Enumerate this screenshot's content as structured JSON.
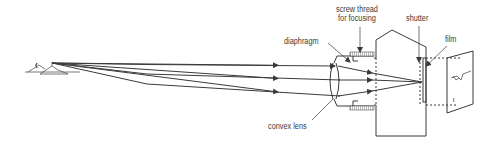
{
  "diagram": {
    "type": "camera-optics",
    "colors": {
      "line": "#3a3a3a",
      "thread": "#555555",
      "background": "#ffffff"
    },
    "labels": {
      "screw_thread_line1": "screw thread",
      "screw_thread_line2": "for focusing",
      "diaphragm": "diaphragm",
      "shutter": "shutter",
      "film": "film",
      "convex_lens": "convex lens"
    }
  }
}
